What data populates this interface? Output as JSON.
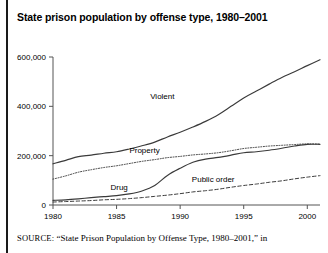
{
  "figure": {
    "title": "State prison population by offense type, 1980–2001",
    "source_prefix": "SOURCE:",
    "source_text": "“State Prison Population by Offense Type, 1980–2001,” in"
  },
  "chart_data": {
    "type": "line",
    "title": "State prison population by offense type, 1980–2001",
    "xlabel": "",
    "ylabel": "",
    "xlim": [
      1980,
      2001
    ],
    "ylim": [
      0,
      600000
    ],
    "grid": false,
    "legend_position": "inline-labels",
    "x_ticks": [
      1980,
      1985,
      1990,
      1995,
      2000
    ],
    "x_tick_labels": [
      "1980",
      "1985",
      "1990",
      "1995",
      "2000"
    ],
    "y_ticks": [
      0,
      200000,
      400000,
      600000
    ],
    "y_tick_labels": [
      "0",
      "200,000",
      "400,000",
      "600,000"
    ],
    "x": [
      1980,
      1981,
      1982,
      1983,
      1984,
      1985,
      1986,
      1987,
      1988,
      1989,
      1990,
      1991,
      1992,
      1993,
      1994,
      1995,
      1996,
      1997,
      1998,
      1999,
      2000,
      2001
    ],
    "series": [
      {
        "name": "Violent",
        "label": "Violent",
        "line_style": "solid",
        "color": "#3a3a3a",
        "label_x": 1988.6,
        "label_y": 430000,
        "values": [
          167000,
          181000,
          196000,
          202000,
          210000,
          216000,
          227000,
          240000,
          255000,
          276000,
          295000,
          316000,
          339000,
          366000,
          400000,
          434000,
          462000,
          490000,
          517000,
          540000,
          565000,
          589000
        ]
      },
      {
        "name": "Property",
        "label": "Property",
        "line_style": "dotted",
        "color": "#6b6b6b",
        "label_x": 1987.2,
        "label_y": 212000,
        "values": [
          105000,
          118000,
          133000,
          143000,
          152000,
          159000,
          168000,
          177000,
          184000,
          192000,
          197000,
          203000,
          207000,
          212000,
          220000,
          229000,
          234000,
          239000,
          242000,
          245000,
          248000,
          247000
        ]
      },
      {
        "name": "Drug",
        "label": "Drug",
        "line_style": "solid",
        "color": "#3a3a3a",
        "label_x": 1985.2,
        "label_y": 62000,
        "values": [
          19000,
          21000,
          25000,
          30000,
          34000,
          38000,
          45000,
          57000,
          79000,
          120000,
          149000,
          173000,
          186000,
          193000,
          202000,
          212000,
          216000,
          222000,
          230000,
          239000,
          246000,
          246000
        ]
      },
      {
        "name": "Public order",
        "label": "Public order",
        "line_style": "dashed",
        "color": "#8a8a8a",
        "label_x": 1992.6,
        "label_y": 92000,
        "values": [
          12000,
          14000,
          16000,
          18000,
          21000,
          23000,
          26000,
          30000,
          35000,
          40000,
          46000,
          53000,
          58000,
          64000,
          72000,
          79000,
          85000,
          92000,
          98000,
          106000,
          113000,
          119000
        ]
      }
    ]
  }
}
